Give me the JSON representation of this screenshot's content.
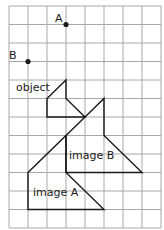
{
  "grid": {
    "origin_x": 9,
    "origin_y": 6,
    "cell_w": 19,
    "cell_h": 18.5,
    "cols": 8,
    "rows": 12,
    "line_color": "#a8a8a8",
    "shape_color": "#1a1a1a"
  },
  "points": [
    {
      "name": "A",
      "label": "A",
      "col": 3,
      "row": 1
    },
    {
      "name": "B",
      "label": "B",
      "col": 1,
      "row": 3
    }
  ],
  "shapes": [
    {
      "name": "object",
      "label": "object",
      "vertices": [
        [
          3,
          4
        ],
        [
          3,
          5
        ],
        [
          4,
          6
        ],
        [
          2,
          6
        ],
        [
          2,
          5
        ]
      ]
    },
    {
      "name": "image-b",
      "label": "image B",
      "vertices": [
        [
          5,
          5
        ],
        [
          5,
          7
        ],
        [
          7,
          9
        ],
        [
          3,
          9
        ],
        [
          3,
          7
        ]
      ]
    },
    {
      "name": "image-a",
      "label": "image A",
      "vertices": [
        [
          1,
          9
        ],
        [
          3,
          7
        ],
        [
          3,
          9
        ],
        [
          5,
          11
        ],
        [
          1,
          11
        ]
      ]
    }
  ],
  "labels": {
    "A": "A",
    "B": "B",
    "object": "object",
    "image_b": "image B",
    "image_a": "image A"
  }
}
